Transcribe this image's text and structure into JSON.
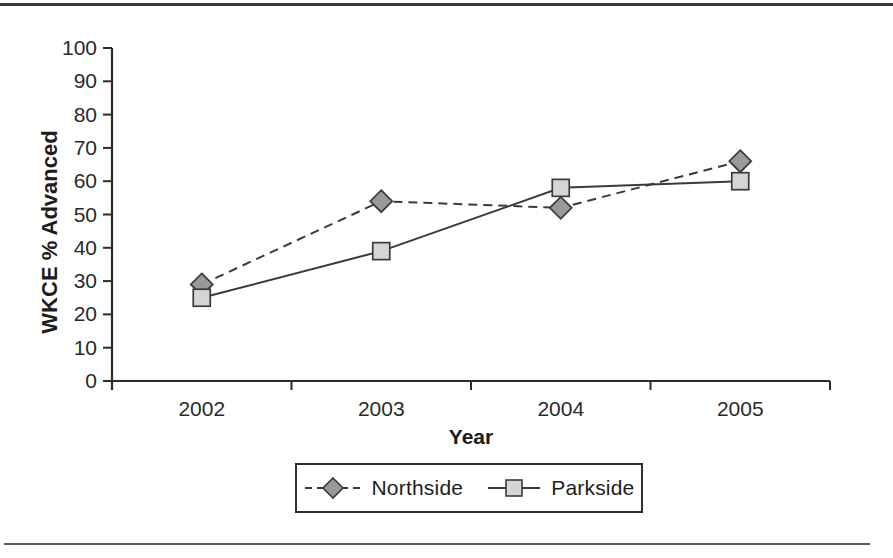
{
  "chart_data": {
    "type": "line",
    "title": "",
    "xlabel": "Year",
    "ylabel": "WKCE % Advanced",
    "categories": [
      "2002",
      "2003",
      "2004",
      "2005"
    ],
    "series": [
      {
        "name": "Northside",
        "values": [
          29,
          54,
          52,
          66
        ],
        "marker": "diamond",
        "line_style": "dashed",
        "marker_fill": "#969a9b",
        "marker_edge": "#3a3a3a",
        "line_color": "#3a3a3a"
      },
      {
        "name": "Parkside",
        "values": [
          25,
          39,
          58,
          60
        ],
        "marker": "square",
        "line_style": "solid",
        "marker_fill": "#d4d6d6",
        "marker_edge": "#3a3a3a",
        "line_color": "#3a3a3a"
      }
    ],
    "ylim": [
      0,
      100
    ],
    "yticks": [
      0,
      10,
      20,
      30,
      40,
      50,
      60,
      70,
      80,
      90,
      100
    ],
    "grid": false,
    "legend_position": "bottom",
    "axis_color": "#2b2b2b",
    "tick_label_color": "#2a2a2a"
  }
}
